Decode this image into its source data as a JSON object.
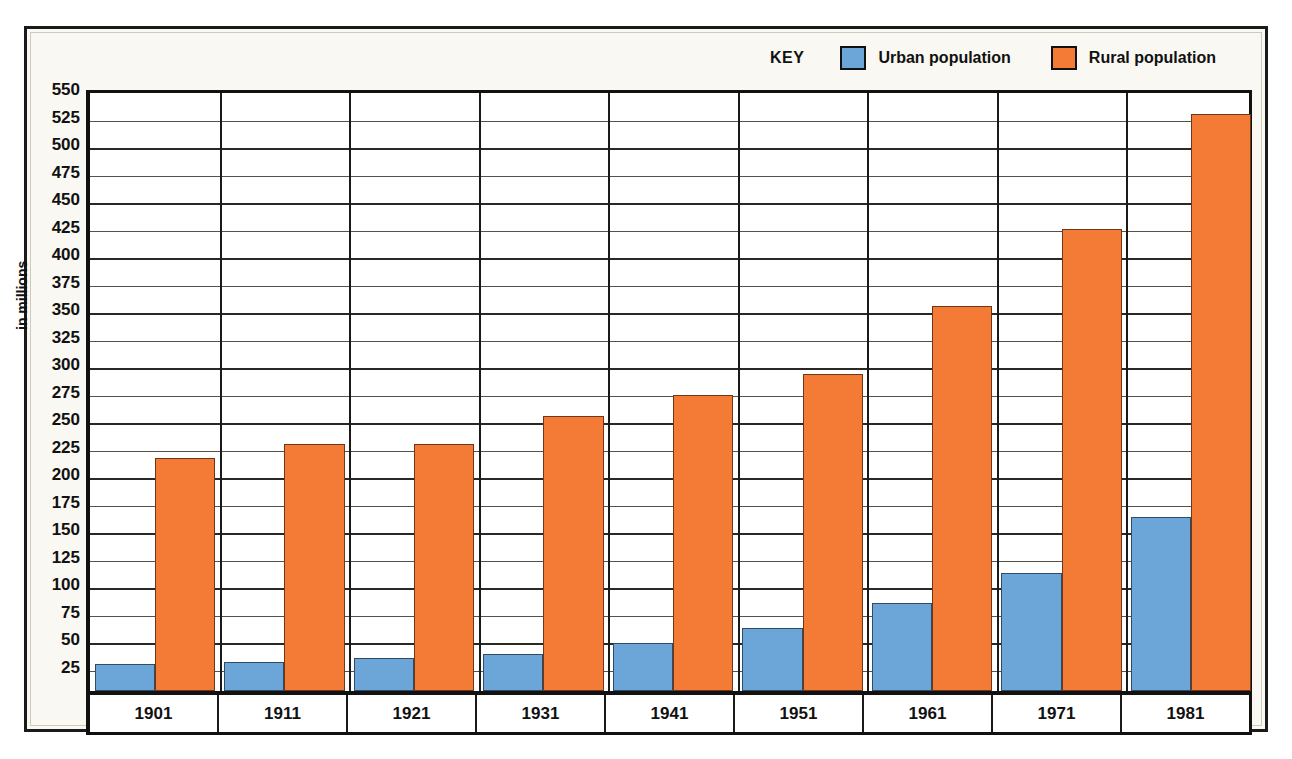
{
  "chart_data": {
    "type": "bar",
    "title": "",
    "subtitle": "",
    "xlabel": "",
    "ylabel": "in millions",
    "ylim": [
      0,
      550
    ],
    "ytick_step": 25,
    "yticks": [
      25,
      50,
      75,
      100,
      125,
      150,
      175,
      200,
      225,
      250,
      275,
      300,
      325,
      350,
      375,
      400,
      425,
      450,
      475,
      500,
      525,
      550
    ],
    "grid": true,
    "legend_position": "top-right",
    "legend_title": "KEY",
    "categories": [
      "1901",
      "1911",
      "1921",
      "1931",
      "1941",
      "1951",
      "1961",
      "1971",
      "1981"
    ],
    "series": [
      {
        "name": "Urban population",
        "color": "#6CA6D9",
        "values": [
          25,
          26,
          30,
          34,
          44,
          57,
          80,
          107,
          158
        ]
      },
      {
        "name": "Rural population",
        "color": "#F47B35",
        "values": [
          212,
          225,
          225,
          250,
          269,
          288,
          350,
          420,
          525
        ]
      }
    ]
  },
  "legend": {
    "title": "KEY",
    "entries": [
      {
        "label": "Urban population",
        "color": "#6CA6D9"
      },
      {
        "label": "Rural population",
        "color": "#F47B35"
      }
    ]
  },
  "axes": {
    "y_title": "in millions"
  },
  "colors": {
    "urban": "#6CA6D9",
    "rural": "#F47B35",
    "frame": "#1A1A1A",
    "paper": "#FAF8F2"
  }
}
